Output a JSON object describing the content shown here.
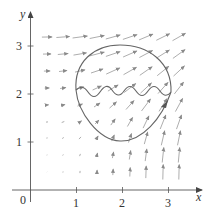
{
  "figure": {
    "type": "vector-field-diagram",
    "axes": {
      "x_label": "x",
      "y_label": "y",
      "origin_label": "0",
      "x_ticks": [
        {
          "value": 1,
          "label": "1"
        },
        {
          "value": 2,
          "label": "2"
        },
        {
          "value": 3,
          "label": "3"
        }
      ],
      "y_ticks": [
        {
          "value": 1,
          "label": "1"
        },
        {
          "value": 2,
          "label": "2"
        },
        {
          "value": 3,
          "label": "3"
        }
      ]
    },
    "pixel_mapping": {
      "origin_px": [
        30.5,
        190
      ],
      "x_unit_px": 46,
      "y_unit_px": 48
    },
    "field_grid": {
      "cols_px": [
        47,
        63,
        80,
        97,
        113,
        130,
        146,
        163,
        179
      ],
      "rows_px": [
        37,
        54,
        71,
        88,
        105,
        122,
        138,
        155,
        172
      ]
    },
    "curve": {
      "description": "closed curve: upper circular arc, wavy line across the middle, lower bowl; arrowhead on right side indicating orientation",
      "wave_humps": 4
    },
    "colors": {
      "axis": "#555555",
      "curve": "#666666",
      "arrow": "#8a8a8a",
      "text": "#333333"
    }
  }
}
